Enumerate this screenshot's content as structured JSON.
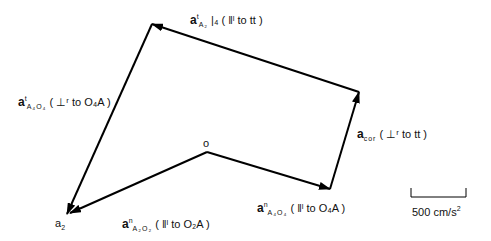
{
  "diagram": {
    "type": "acceleration-polygon",
    "origin_label": "o",
    "end_label": "a",
    "end_label_sub": "2",
    "vectors": [
      {
        "id": "a_n_A4O4",
        "symbol": "a",
        "sup": "n",
        "sub": "A₄O₄",
        "desc": "( ‖ˡ to O₄A )"
      },
      {
        "id": "a_cor",
        "symbol": "a",
        "sup": "",
        "sub": "cor",
        "desc": "( ⊥ʳ to tt )"
      },
      {
        "id": "a_t_A2_4",
        "symbol": "a",
        "sup": "t",
        "sub": "A₂",
        "extra": "|₄",
        "desc": "( ‖ˡ to tt )"
      },
      {
        "id": "a_t_A4O4",
        "symbol": "a",
        "sup": "t",
        "sub": "A₄O₄",
        "desc": "( ⊥ʳ to O₄A )"
      },
      {
        "id": "a_n_A2O2",
        "symbol": "a",
        "sup": "n",
        "sub": "A₂O₂",
        "desc": "( ‖ˡ to O₂A )"
      }
    ],
    "scale": {
      "label": "500 cm/s",
      "exp": "2"
    }
  }
}
